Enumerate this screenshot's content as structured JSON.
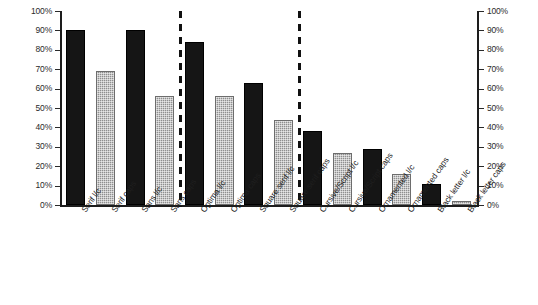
{
  "chart_data": {
    "type": "bar",
    "title": "",
    "subtitle": "",
    "xlabel": "",
    "ylabel": "",
    "ylim": [
      0,
      100
    ],
    "yunit": "%",
    "grid": false,
    "legend": "none",
    "dual_axis": true,
    "axis_tick_labels": [
      "100%",
      "90%",
      "80%",
      "70%",
      "60%",
      "50%",
      "40%",
      "30%",
      "20%",
      "10%",
      "0%"
    ],
    "axis_tick_values": [
      100,
      90,
      80,
      70,
      60,
      50,
      40,
      30,
      20,
      10,
      0
    ],
    "left_axis_labels": [
      "100%",
      "90%",
      "80%",
      "70%",
      "60%",
      "50%",
      "40%",
      "30%",
      "20%",
      "10%",
      "0%"
    ],
    "right_axis_labels": [
      "100%",
      "90%",
      "80%",
      "70%",
      "60%",
      "50%",
      "40%",
      "30%",
      "20%",
      "10%",
      "0%"
    ],
    "categories": [
      "Serif l/c",
      "Serif caps",
      "Sans l/c",
      "Sans caps",
      "Optima l/c",
      "Optima caps",
      "Square serif l/c",
      "Square serif caps",
      "Cursive/Script l/c",
      "Cursive/Script caps",
      "Ornamented l/c",
      "Ornamented caps",
      "Black letter l/c",
      "Black letter caps"
    ],
    "values": [
      90,
      69,
      90,
      56,
      84,
      56,
      63,
      44,
      38,
      27,
      29,
      16,
      11,
      2
    ],
    "bar_styles": [
      "dark",
      "gray",
      "dark",
      "gray",
      "dark",
      "gray",
      "dark",
      "gray",
      "dark",
      "gray",
      "dark",
      "gray",
      "dark",
      "gray"
    ],
    "groups": [
      {
        "name": "group-1",
        "category_indices": [
          0,
          1,
          2,
          3
        ]
      },
      {
        "name": "group-2",
        "category_indices": [
          4,
          5,
          6,
          7
        ]
      },
      {
        "name": "group-3",
        "category_indices": [
          8,
          9,
          10,
          11,
          12,
          13
        ]
      }
    ],
    "separators_after_category_index": [
      3,
      7
    ],
    "colors": {
      "dark_bar": "#151515",
      "gray_bar": "#8f8f8f",
      "shadow": "#d6d6d6",
      "axis": "#1d1d1d",
      "text": "#1f1f1f",
      "background": "#ffffff"
    }
  }
}
